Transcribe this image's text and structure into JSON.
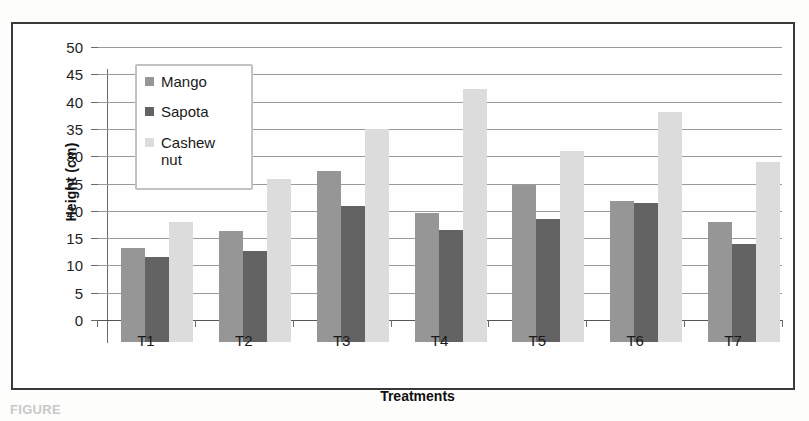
{
  "chart_data": {
    "type": "bar",
    "title": "",
    "xlabel": "Treatments",
    "ylabel": "Height (cm)",
    "categories": [
      "T1",
      "T2",
      "T3",
      "T4",
      "T5",
      "T6",
      "T7"
    ],
    "series": [
      {
        "name": "Mango",
        "color": "#969696",
        "values": [
          17.3,
          20.3,
          31.4,
          23.6,
          28.7,
          25.8,
          22.0
        ]
      },
      {
        "name": "Sapota",
        "color": "#636363",
        "values": [
          15.5,
          16.7,
          25.0,
          20.6,
          22.5,
          25.4,
          18.0
        ]
      },
      {
        "name": "Cashew nut",
        "color": "#dcdcdc",
        "values": [
          22.0,
          29.8,
          39.1,
          46.3,
          35.0,
          42.2,
          32.9
        ]
      }
    ],
    "ylim": [
      0,
      50
    ],
    "ytick_step": 5,
    "yticks": [
      0,
      5,
      10,
      15,
      20,
      25,
      30,
      35,
      40,
      45,
      50
    ],
    "ytick_labels": [
      "0",
      "5",
      "10",
      "15",
      "20",
      "25",
      "30",
      "35",
      "40",
      "45",
      "50"
    ],
    "grid": true,
    "legend_position": "upper-left-inside",
    "legend_entries": [
      "Mango",
      "Sapota",
      "Cashew\nnut"
    ]
  },
  "caption": "FIGURE"
}
